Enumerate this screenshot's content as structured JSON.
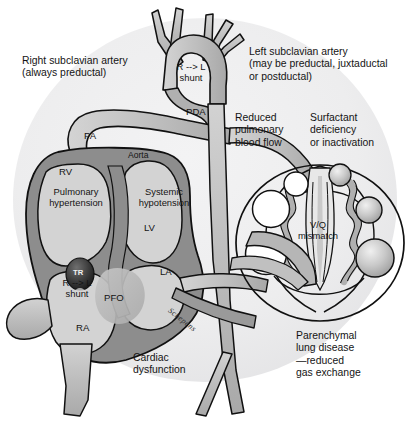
{
  "figure": {
    "width": 408,
    "height": 426,
    "background_color": "#ffffff",
    "disc_color": "#ececed",
    "myocardium_color": "#8d8d8d",
    "chamber_color": "#d3d3d3",
    "vessel_color": "#c3c3c3",
    "vessel_dark_color": "#9a9a9a",
    "outline_color": "#111111",
    "defect_color": "#b9b9b9",
    "alveoli_open_color": "#ffffff",
    "alveoli_filled_color": "#b5b5b5"
  },
  "callouts": [
    {
      "name": "right-subclavian-artery",
      "lines": [
        "Right subclavian artery",
        "(always preductal)"
      ],
      "x": 22,
      "y": 55
    },
    {
      "name": "left-subclavian-artery",
      "lines": [
        "Left subclavian artery",
        "(may be preductal, juxtaductal",
        "or postductal)"
      ],
      "x": 249,
      "y": 46
    },
    {
      "name": "reduced-pulmonary-blood-flow",
      "lines": [
        "Reduced",
        "pulmonary",
        "blood flow"
      ],
      "x": 235,
      "y": 112
    },
    {
      "name": "surfactant-deficiency",
      "lines": [
        "Surfactant",
        "deficiency",
        "or inactivation"
      ],
      "x": 310,
      "y": 112
    },
    {
      "name": "parenchymal-lung-disease",
      "lines": [
        "Parenchymal",
        "lung disease",
        "—reduced",
        "gas exchange"
      ],
      "x": 296,
      "y": 330
    },
    {
      "name": "cardiac-dysfunction",
      "lines": [
        "Cardiac",
        "dysfunction"
      ],
      "x": 133,
      "y": 352
    }
  ],
  "anatomy_labels": [
    {
      "name": "pulmonary-artery",
      "text": "PA",
      "x": 84,
      "y": 130,
      "size": "anat"
    },
    {
      "name": "aorta",
      "text": "Aorta",
      "x": 128,
      "y": 150,
      "size": "anat-sm"
    },
    {
      "name": "patent-ductus-arteriosus",
      "text": "PDA",
      "x": 186,
      "y": 106,
      "size": "anat"
    },
    {
      "name": "right-ventricle",
      "text": "RV",
      "x": 59,
      "y": 166,
      "size": "anat"
    },
    {
      "name": "left-ventricle",
      "text": "LV",
      "x": 144,
      "y": 222,
      "size": "anat"
    },
    {
      "name": "left-atrium",
      "text": "LA",
      "x": 160,
      "y": 266,
      "size": "anat"
    },
    {
      "name": "right-atrium",
      "text": "RA",
      "x": 76,
      "y": 322,
      "size": "anat"
    },
    {
      "name": "patent-foramen-ovale",
      "text": "PFO",
      "x": 124,
      "y": 296,
      "size": "anat"
    }
  ],
  "inner_labels": [
    {
      "name": "pulmonary-hypertension",
      "lines": [
        "Pulmonary",
        "hypertension"
      ],
      "x": 28,
      "y": 186,
      "width": 96
    },
    {
      "name": "systemic-hypotension",
      "lines": [
        "Systemic",
        "hypotension"
      ],
      "x": 124,
      "y": 186,
      "width": 82
    },
    {
      "name": "ductal-right-to-left-shunt",
      "lines": [
        "R --> L",
        "shunt"
      ],
      "x": 168,
      "y": 61,
      "width": 48
    },
    {
      "name": "atrial-right-to-left-shunt",
      "lines": [
        "R --> L",
        "shunt"
      ],
      "x": 52,
      "y": 277,
      "width": 52
    },
    {
      "name": "ventilation-perfusion-mismatch",
      "lines": [
        "V/Q",
        "mismatch"
      ],
      "x": 276,
      "y": 219,
      "width": 62
    }
  ],
  "markers": [
    {
      "name": "tricuspid-regurgitation",
      "text": "TR",
      "x": 72,
      "y": 268
    }
  ],
  "signature": {
    "name": "artist-signature",
    "text": "Schepens",
    "x": 172,
    "y": 310
  }
}
